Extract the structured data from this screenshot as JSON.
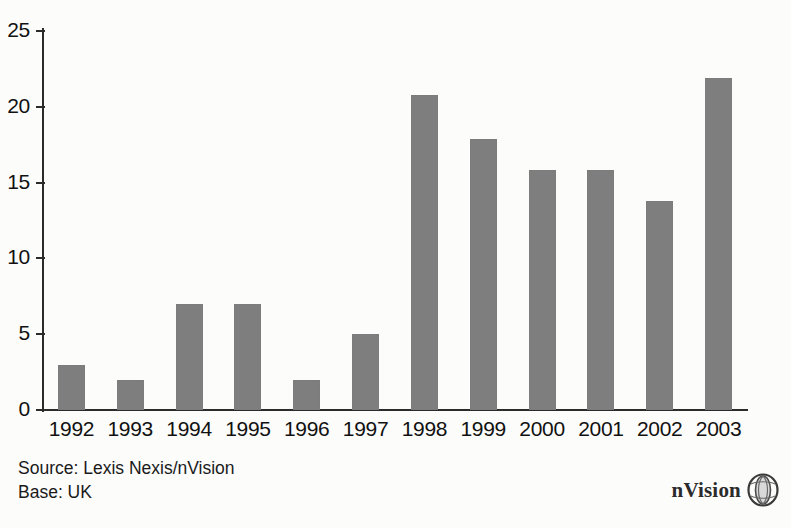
{
  "chart_data": {
    "type": "bar",
    "title": "",
    "subtitle": "",
    "xlabel": "",
    "ylabel": "",
    "categories": [
      "1992",
      "1993",
      "1994",
      "1995",
      "1996",
      "1997",
      "1998",
      "1999",
      "2000",
      "2001",
      "2002",
      "2003"
    ],
    "values": [
      3,
      2,
      7,
      7,
      2,
      5,
      20.8,
      17.9,
      15.8,
      15.8,
      13.8,
      21.9
    ],
    "series": [
      {
        "name": "",
        "values": [
          3,
          2,
          7,
          7,
          2,
          5,
          20.8,
          17.9,
          15.8,
          15.8,
          13.8,
          21.9
        ]
      }
    ],
    "ylim": [
      0,
      25
    ],
    "yticks": [
      0,
      5,
      10,
      15,
      20,
      25
    ],
    "ytick_labels": [
      "0",
      "5",
      "10",
      "15",
      "20",
      "25"
    ],
    "grid": false,
    "legend": false,
    "legend_position": "none",
    "bar_color": "#7e7e7e",
    "axis_color": "#2b2b2b",
    "background_color": "#fcfcfa"
  },
  "footer": {
    "source": "Source: Lexis Nexis/nVision",
    "base": "Base: UK"
  },
  "logo": {
    "text": "nVision",
    "mark": "globe-icon"
  }
}
